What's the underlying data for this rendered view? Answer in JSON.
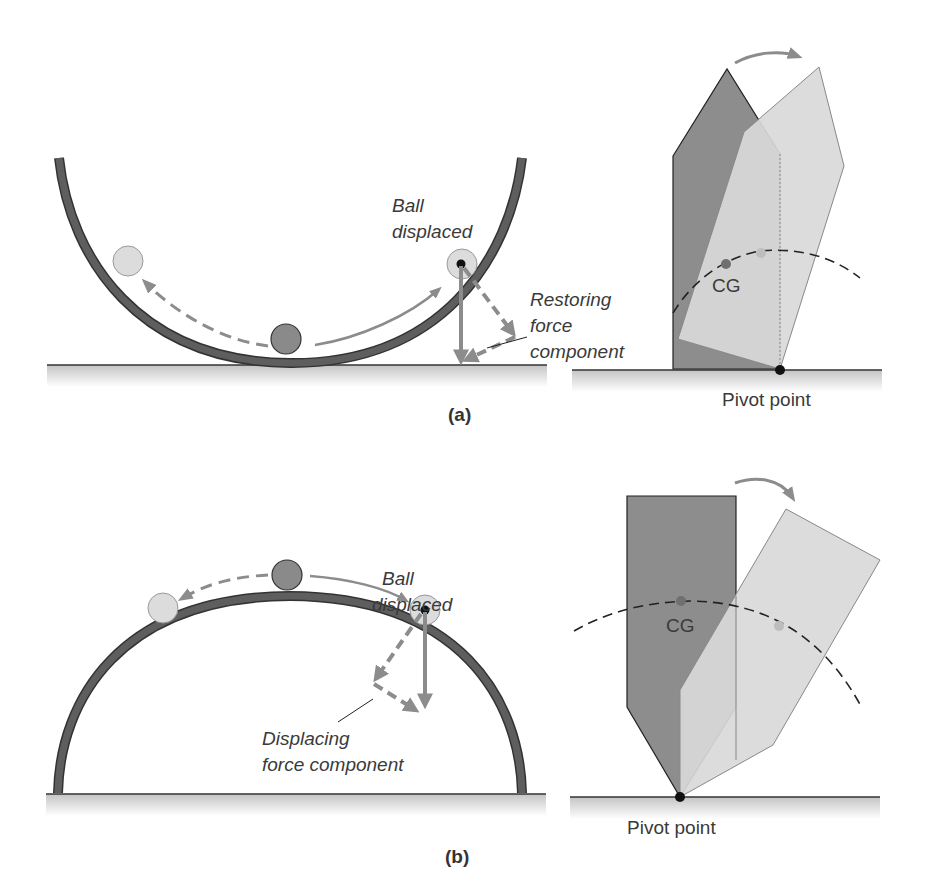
{
  "colors": {
    "track": "#555555",
    "track_edge": "#333333",
    "ball_dark": "#8a8a8a",
    "ball_light": "#dcdcdc",
    "arrow": "#8c8c8c",
    "block_dark": "#8d8d8d",
    "block_light": "#d9d9d9",
    "ground": "#cfcfcf",
    "text": "#3a3a3a"
  },
  "panel_a": {
    "caption": "(a)",
    "bowl": {
      "ball_label_line1": "Ball",
      "ball_label_line2": "displaced",
      "force_label_line1": "Restoring",
      "force_label_line2": "force",
      "force_label_line3": "component"
    },
    "block": {
      "cg_label": "CG",
      "pivot_label": "Pivot point"
    }
  },
  "panel_b": {
    "caption": "(b)",
    "dome": {
      "ball_label_line1": "Ball",
      "ball_label_line2": "displaced",
      "force_label_line1": "Displacing",
      "force_label_line2": "force component"
    },
    "block": {
      "cg_label": "CG",
      "pivot_label": "Pivot point"
    }
  }
}
